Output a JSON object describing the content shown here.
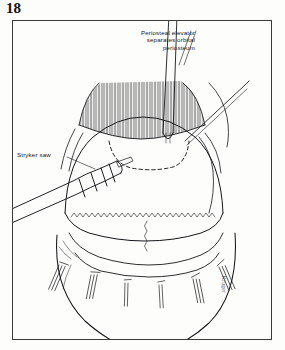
{
  "figure": {
    "number": "18",
    "domain": "surgical-illustration",
    "caption_present": false
  },
  "frame": {
    "border_color": "#3a3a38",
    "background_color": "#fdfdfb",
    "ink_color": "#1a1a1a"
  },
  "labels": {
    "elevator": {
      "line1": "Periosteal elevator",
      "line2": "separates orbital",
      "line3": "periosteum",
      "full_text": "Periosteal elevator separates orbital periosteum",
      "leader": "diagonal double-line to instrument shaft"
    },
    "saw": {
      "text": "Stryker saw",
      "leader": "horizontal dash to saw body"
    }
  },
  "signature": {
    "text": "Kruger",
    "orientation": "vertical"
  },
  "illustration": {
    "subject": "Craniotomy with scalp flap reflected",
    "elements": [
      {
        "name": "scalp-flap-hatching",
        "description": "dense vertical hatch lines, reflected scalp"
      },
      {
        "name": "dashed-osteotomy-outline",
        "description": "dashed curved line marking bone flap"
      },
      {
        "name": "cranium-dome",
        "description": "large rounded skull outline"
      },
      {
        "name": "zigzag-suture-line",
        "description": "serrated line across mid skull"
      },
      {
        "name": "stryker-saw",
        "description": "cylindrical powered saw entering from left"
      },
      {
        "name": "periosteal-elevator",
        "description": "thin flat blade instrument from top"
      },
      {
        "name": "retractor-hooks",
        "description": "row of small clamps along lower margin"
      },
      {
        "name": "skin-edge-curve",
        "description": "large arc forming lower head contour"
      }
    ]
  }
}
